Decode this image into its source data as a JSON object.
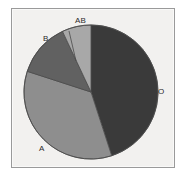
{
  "chart_data": {
    "type": "pie",
    "title": "",
    "subtitle": "",
    "xlabel": "",
    "ylabel": "",
    "legend_position": "none",
    "grid": false,
    "labels_position": "outside",
    "start_angle_deg": 0,
    "direction": "clockwise",
    "categories": [
      "O",
      "A",
      "B",
      "AB"
    ],
    "values": [
      45,
      35,
      13,
      7
    ],
    "slices": [
      {
        "label": "O",
        "value": 45,
        "color": "#3a3a3a"
      },
      {
        "label": "A",
        "value": 35,
        "color": "#8e8e8e"
      },
      {
        "label": "B",
        "value": 13,
        "color": "#616161"
      },
      {
        "label": "AB",
        "value": 7,
        "color": "#a8a8a8"
      }
    ],
    "annotations": []
  },
  "figure": {
    "background_color": "#f2f1ef",
    "border_color": "#9a9a9a",
    "page_background": "#ffffff",
    "slice_outline_color": "#4a4a4a"
  },
  "labels": {
    "o": "O",
    "a": "A",
    "b": "B",
    "ab": "AB"
  }
}
